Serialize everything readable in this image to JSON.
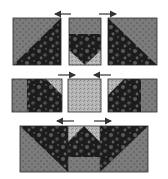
{
  "diagram": {
    "type": "quilt-block-assembly",
    "colors": {
      "background": "#ffffff",
      "gray_fabric": "#7c7c7c",
      "gray_dot": "#4a4a4a",
      "dark_fabric": "#1c1c1c",
      "dark_blotch": "#5a5a5a",
      "light_fabric": "#b4b4b4",
      "light_speck": "#8a8a8a",
      "border": "#2a2a2a",
      "arrow": "#333333"
    },
    "rows": [
      {
        "id": "row-1",
        "arrows": [
          {
            "direction": "left",
            "x1": 55,
            "x2": 71,
            "y": 14
          },
          {
            "direction": "right",
            "x1": 99,
            "x2": 116,
            "y": 14
          }
        ],
        "units": [
          {
            "name": "half-square-triangle-left",
            "x": 13,
            "y": 18,
            "w": 48,
            "h": 47
          },
          {
            "name": "flying-goose-center",
            "x": 69,
            "y": 18,
            "w": 32,
            "h": 47
          },
          {
            "name": "half-square-triangle-right",
            "x": 108,
            "y": 18,
            "w": 49,
            "h": 47
          }
        ]
      },
      {
        "id": "row-2",
        "arrows": [
          {
            "direction": "right",
            "x1": 58,
            "x2": 75,
            "y": 75
          },
          {
            "direction": "left",
            "x1": 94,
            "x2": 111,
            "y": 75
          }
        ],
        "units": [
          {
            "name": "side-unit-left",
            "x": 12,
            "y": 79,
            "w": 50,
            "h": 33
          },
          {
            "name": "center-square",
            "x": 68,
            "y": 79,
            "w": 33,
            "h": 33
          },
          {
            "name": "side-unit-right",
            "x": 108,
            "y": 79,
            "w": 49,
            "h": 33
          }
        ]
      },
      {
        "id": "row-3",
        "arrows": [
          {
            "direction": "left",
            "x1": 57,
            "x2": 74,
            "y": 121
          },
          {
            "direction": "right",
            "x1": 94,
            "x2": 111,
            "y": 121
          }
        ],
        "units": [
          {
            "name": "bottom-row-strip",
            "x": 20,
            "y": 126,
            "w": 128,
            "h": 46
          }
        ]
      }
    ]
  }
}
